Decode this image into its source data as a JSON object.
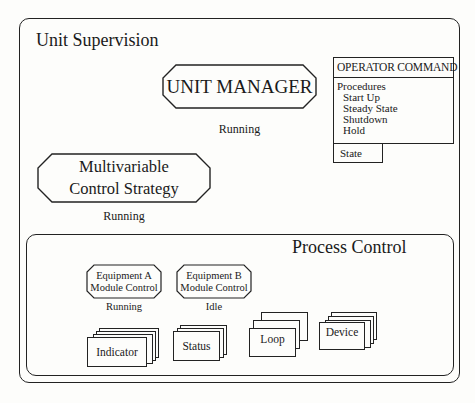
{
  "unit_supervision": {
    "title": "Unit Supervision",
    "unit_manager": {
      "label": "UNIT MANAGER",
      "status": "Running"
    },
    "multivariable_control": {
      "label_line1": "Multivariable",
      "label_line2": "Control Strategy",
      "status": "Running"
    },
    "operator_command": {
      "title": "OPERATOR COMMAND",
      "procedures_label": "Procedures",
      "procedures": [
        "Start Up",
        "Steady State",
        "Shutdown",
        "Hold"
      ],
      "state_label": "State"
    }
  },
  "process_control": {
    "title": "Process Control",
    "equipment_modules": [
      {
        "label_line1": "Equipment A",
        "label_line2": "Module Control",
        "status": "Running"
      },
      {
        "label_line1": "Equipment B",
        "label_line2": "Module Control",
        "status": "Idle"
      }
    ],
    "module_stacks": [
      {
        "label": "Indicator"
      },
      {
        "label": "Status"
      },
      {
        "label": "Loop"
      },
      {
        "label": "Device"
      }
    ]
  },
  "colors": {
    "line": "#222222",
    "background": "#fdfdfb"
  }
}
